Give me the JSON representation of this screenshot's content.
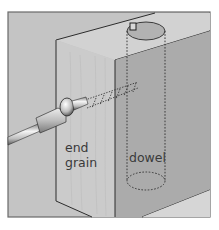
{
  "diagram": {
    "type": "illustration",
    "labels": {
      "end_grain_line1": "end",
      "end_grain_line2": "grain",
      "dowel": "dowel"
    },
    "colors": {
      "background": "#c4c4c4",
      "frame": "#6a6a6a",
      "block_top": "#d0d0d0",
      "block_front": "#c9c9c9",
      "block_side": "#a9a9a9",
      "dowel_top": "#b0b0b0",
      "outline": "#2c2c2c",
      "hidden_line": "#444444",
      "screwdriver_metal": "#e6e6e6"
    }
  }
}
